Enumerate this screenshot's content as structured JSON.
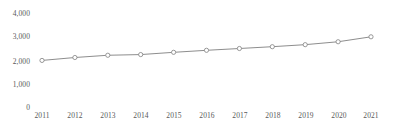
{
  "chart_data": {
    "type": "line",
    "title": "",
    "subtitle": "",
    "xlabel": "",
    "ylabel": "",
    "categories": [
      "2011",
      "2012",
      "2013",
      "2014",
      "2015",
      "2016",
      "2017",
      "2018",
      "2019",
      "2020",
      "2021"
    ],
    "values": [
      2070,
      2200,
      2300,
      2330,
      2430,
      2520,
      2600,
      2680,
      2770,
      2900,
      3120
    ],
    "series": [
      {
        "name": "",
        "values": [
          2070,
          2200,
          2300,
          2330,
          2430,
          2520,
          2600,
          2680,
          2770,
          2900,
          3120
        ]
      }
    ],
    "ylim": [
      0,
      4000
    ],
    "y_ticks": [
      0,
      1000,
      2000,
      3000,
      4000
    ],
    "y_tick_labels": [
      "0",
      "1,000",
      "2,000",
      "3,000",
      "4,000"
    ],
    "grid": false,
    "legend": "none",
    "marker": "open-circle",
    "line_color": "#808080",
    "marker_color": "#808080",
    "marker_fill": "#ffffff",
    "text_color": "#595959",
    "background": "#ffffff"
  }
}
